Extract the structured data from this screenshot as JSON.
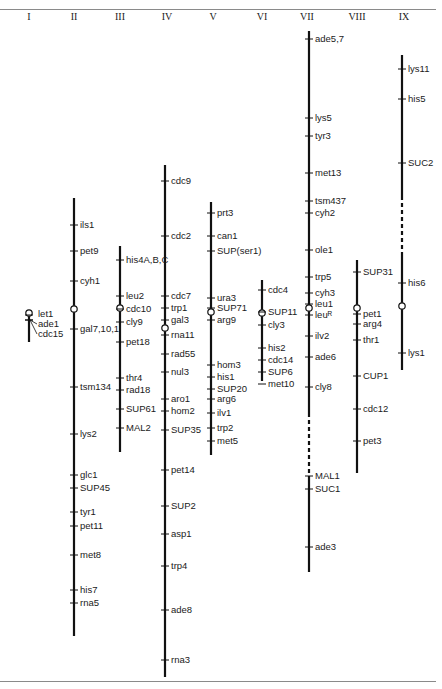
{
  "figure": {
    "chromosome_labels": [
      "I",
      "II",
      "III",
      "IV",
      "V",
      "VI",
      "VII",
      "VIII",
      "IX"
    ],
    "colors": {
      "line": "#111111",
      "rule": "#8a8a8a",
      "text": "#1a1a1a",
      "background": "#ffffff"
    }
  },
  "chromosomes": [
    {
      "id": "I",
      "x": 29,
      "top": 313,
      "bottom": 342,
      "centromere": 313,
      "dashed": [],
      "loci": [
        {
          "name": "let1",
          "y": 315,
          "ly": 314,
          "lx": 38
        },
        {
          "name": "ade1",
          "y": 320,
          "ly": 324,
          "lx": 38
        },
        {
          "name": "cdc15",
          "y": 320,
          "ly": 334,
          "lx": 38
        }
      ]
    },
    {
      "id": "II",
      "x": 74,
      "top": 198,
      "bottom": 636,
      "centromere": 309,
      "dashed": [],
      "loci": [
        {
          "name": "ils1",
          "y": 225
        },
        {
          "name": "pet9",
          "y": 251
        },
        {
          "name": "cyh1",
          "y": 281
        },
        {
          "name": "gal7,10,1",
          "y": 329
        },
        {
          "name": "tsm134",
          "y": 387
        },
        {
          "name": "lys2",
          "y": 434
        },
        {
          "name": "glc1",
          "y": 475
        },
        {
          "name": "SUP45",
          "y": 488
        },
        {
          "name": "tyr1",
          "y": 512
        },
        {
          "name": "pet11",
          "y": 526
        },
        {
          "name": "met8",
          "y": 555
        },
        {
          "name": "his7",
          "y": 590
        },
        {
          "name": "rna5",
          "y": 603
        }
      ]
    },
    {
      "id": "III",
      "x": 120,
      "top": 246,
      "bottom": 452,
      "centromere": 308,
      "dashed": [],
      "loci": [
        {
          "name": "his4A,B,C",
          "y": 260
        },
        {
          "name": "leu2",
          "y": 296
        },
        {
          "name": "cdc10",
          "y": 309
        },
        {
          "name": "cly9",
          "y": 322
        },
        {
          "name": "pet18",
          "y": 342
        },
        {
          "name": "thr4",
          "y": 378
        },
        {
          "name": "rad18",
          "y": 390
        },
        {
          "name": "SUP61",
          "y": 409
        },
        {
          "name": "MAL2",
          "y": 428
        }
      ]
    },
    {
      "id": "IV",
      "x": 165,
      "top": 165,
      "bottom": 677,
      "centromere": 328,
      "dashed": [],
      "loci": [
        {
          "name": "cdc9",
          "y": 181
        },
        {
          "name": "cdc2",
          "y": 236
        },
        {
          "name": "cdc7",
          "y": 296
        },
        {
          "name": "trp1",
          "y": 308
        },
        {
          "name": "gal3",
          "y": 320
        },
        {
          "name": "rna11",
          "y": 335
        },
        {
          "name": "rad55",
          "y": 354
        },
        {
          "name": "nul3",
          "y": 372
        },
        {
          "name": "aro1",
          "y": 399
        },
        {
          "name": "hom2",
          "y": 411
        },
        {
          "name": "SUP35",
          "y": 430
        },
        {
          "name": "pet14",
          "y": 470
        },
        {
          "name": "SUP2",
          "y": 506
        },
        {
          "name": "asp1",
          "y": 534
        },
        {
          "name": "trp4",
          "y": 566
        },
        {
          "name": "ade8",
          "y": 610
        },
        {
          "name": "rna3",
          "y": 660
        }
      ]
    },
    {
      "id": "V",
      "x": 211,
      "top": 202,
      "bottom": 455,
      "centromere": 312,
      "dashed": [],
      "loci": [
        {
          "name": "prt3",
          "y": 213
        },
        {
          "name": "can1",
          "y": 236
        },
        {
          "name": "SUP(ser1)",
          "y": 251
        },
        {
          "name": "ura3",
          "y": 298
        },
        {
          "name": "SUP71",
          "y": 308
        },
        {
          "name": "arg9",
          "y": 320
        },
        {
          "name": "hom3",
          "y": 365
        },
        {
          "name": "his1",
          "y": 377
        },
        {
          "name": "SUP20",
          "y": 389
        },
        {
          "name": "arg6",
          "y": 399
        },
        {
          "name": "ilv1",
          "y": 413
        },
        {
          "name": "trp2",
          "y": 428
        },
        {
          "name": "met5",
          "y": 441
        }
      ]
    },
    {
      "id": "VI",
      "x": 262,
      "top": 280,
      "bottom": 381,
      "centromere": 313,
      "dashed": [],
      "loci": [
        {
          "name": "cdc4",
          "y": 290
        },
        {
          "name": "SUP11",
          "y": 312
        },
        {
          "name": "cly3",
          "y": 325
        },
        {
          "name": "his2",
          "y": 348
        },
        {
          "name": "cdc14",
          "y": 360
        },
        {
          "name": "SUP6",
          "y": 372
        },
        {
          "name": "met10",
          "y": 384
        }
      ]
    },
    {
      "id": "VII",
      "x": 309,
      "top": 31,
      "bottom": 572,
      "centromere": 308,
      "dashed": [
        [
          413,
          478
        ]
      ],
      "loci": [
        {
          "name": "ade5,7",
          "y": 39
        },
        {
          "name": "lys5",
          "y": 118
        },
        {
          "name": "tyr3",
          "y": 136
        },
        {
          "name": "met13",
          "y": 173
        },
        {
          "name": "tsm437",
          "y": 201
        },
        {
          "name": "cyh2",
          "y": 213
        },
        {
          "name": "ole1",
          "y": 250
        },
        {
          "name": "trp5",
          "y": 277
        },
        {
          "name": "cyh3",
          "y": 293
        },
        {
          "name": "leu1",
          "y": 304
        },
        {
          "name": "leuᴿ",
          "y": 315
        },
        {
          "name": "ilv2",
          "y": 336
        },
        {
          "name": "ade6",
          "y": 357
        },
        {
          "name": "cly8",
          "y": 387
        },
        {
          "name": "MAL1",
          "y": 476
        },
        {
          "name": "SUC1",
          "y": 489
        },
        {
          "name": "ade3",
          "y": 547
        }
      ]
    },
    {
      "id": "VIII",
      "x": 357,
      "top": 260,
      "bottom": 473,
      "centromere": 308,
      "dashed": [],
      "loci": [
        {
          "name": "SUP31",
          "y": 272
        },
        {
          "name": "pet1",
          "y": 314
        },
        {
          "name": "arg4",
          "y": 324
        },
        {
          "name": "thr1",
          "y": 340
        },
        {
          "name": "CUP1",
          "y": 376
        },
        {
          "name": "cdc12",
          "y": 409
        },
        {
          "name": "pet3",
          "y": 441
        }
      ]
    },
    {
      "id": "IX",
      "x": 402,
      "top": 55,
      "bottom": 370,
      "centromere": 306,
      "dashed": [
        [
          196,
          255
        ]
      ],
      "loci": [
        {
          "name": "lys11",
          "y": 69
        },
        {
          "name": "his5",
          "y": 99
        },
        {
          "name": "SUC2",
          "y": 163
        },
        {
          "name": "his6",
          "y": 283
        },
        {
          "name": "lys1",
          "y": 353
        }
      ]
    }
  ]
}
